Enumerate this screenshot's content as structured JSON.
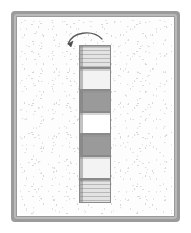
{
  "illustration": {
    "title": "Vertical stack of seven blocks with a curved arrow removing the top block",
    "frame": {
      "border_color": "#9b9b9b",
      "inner_border_color": "#b9b9b9",
      "background_color": "#fdfdfd"
    },
    "arrow": {
      "name": "curved-arrow",
      "direction": "down-left",
      "meaning": "move top block off the stack",
      "color": "#5a5a5a"
    },
    "stack": {
      "count": 7,
      "order": "top-to-bottom",
      "blocks": [
        {
          "index": 1,
          "tone": "hatched-light-gray",
          "color": "#e3e3e3",
          "height": 23
        },
        {
          "index": 2,
          "tone": "light",
          "color": "#f3f3f3",
          "height": 22
        },
        {
          "index": 3,
          "tone": "dark",
          "color": "#9a9a9a",
          "height": 22
        },
        {
          "index": 4,
          "tone": "white",
          "color": "#ffffff",
          "height": 22
        },
        {
          "index": 5,
          "tone": "dark",
          "color": "#9a9a9a",
          "height": 22
        },
        {
          "index": 6,
          "tone": "light",
          "color": "#f3f3f3",
          "height": 23
        },
        {
          "index": 7,
          "tone": "hatched-light-gray",
          "color": "#e3e3e3",
          "height": 24
        }
      ]
    }
  }
}
